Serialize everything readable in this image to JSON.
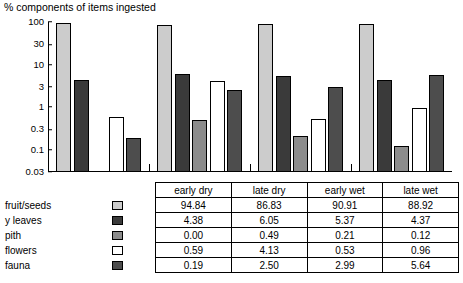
{
  "chart_data": {
    "type": "bar",
    "title": "% components of items ingested",
    "ylabel": "",
    "xlabel": "",
    "log_scale": true,
    "ylim": [
      0.03,
      100
    ],
    "yticks": [
      "100",
      "30",
      "10",
      "3",
      "1",
      "0.3",
      "0.1",
      "0.03"
    ],
    "ytick_values": [
      100,
      30,
      10,
      3,
      1,
      0.3,
      0.1,
      0.03
    ],
    "categories": [
      "early dry",
      "late dry",
      "early wet",
      "late wet"
    ],
    "series": [
      {
        "name": "fruit/seeds",
        "color": "#cccccc",
        "values": [
          94.84,
          86.83,
          90.91,
          88.92
        ]
      },
      {
        "name": "y leaves",
        "color": "#3a3a3a",
        "values": [
          4.38,
          6.05,
          5.37,
          4.37
        ]
      },
      {
        "name": "pith",
        "color": "#8c8c8c",
        "values": [
          0.0,
          0.49,
          0.21,
          0.12
        ]
      },
      {
        "name": "flowers",
        "color": "#ffffff",
        "values": [
          0.59,
          4.13,
          0.53,
          0.96
        ]
      },
      {
        "name": "fauna",
        "color": "#4d4d4d",
        "values": [
          0.19,
          2.5,
          2.99,
          5.64
        ]
      }
    ]
  },
  "table": {
    "headers": [
      "early dry",
      "late dry",
      "early wet",
      "late wet"
    ],
    "rows": [
      {
        "label": "fruit/seeds",
        "color": "#cccccc",
        "values": [
          "94.84",
          "86.83",
          "90.91",
          "88.92"
        ]
      },
      {
        "label": "y leaves",
        "color": "#3a3a3a",
        "values": [
          "4.38",
          "6.05",
          "5.37",
          "4.37"
        ]
      },
      {
        "label": "pith",
        "color": "#8c8c8c",
        "values": [
          "0.00",
          "0.49",
          "0.21",
          "0.12"
        ]
      },
      {
        "label": "flowers",
        "color": "#ffffff",
        "values": [
          "0.59",
          "4.13",
          "0.53",
          "0.96"
        ]
      },
      {
        "label": "fauna",
        "color": "#4d4d4d",
        "values": [
          "0.19",
          "2.50",
          "2.99",
          "5.64"
        ]
      }
    ]
  }
}
